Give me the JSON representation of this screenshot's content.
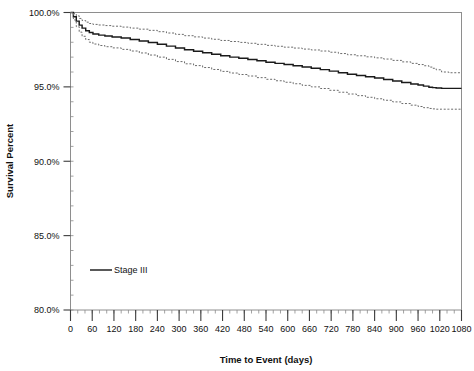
{
  "chart_data": {
    "type": "line",
    "title": "",
    "xlabel": "Time to Event (days)",
    "ylabel": "Survival Percent",
    "xlim": [
      0,
      1080
    ],
    "ylim": [
      80,
      100
    ],
    "grid": false,
    "legend_position": "inside-left",
    "x_ticks": [
      0,
      60,
      120,
      180,
      240,
      300,
      360,
      420,
      480,
      540,
      600,
      660,
      720,
      780,
      840,
      900,
      960,
      1020,
      1080
    ],
    "x_tick_labels": [
      "0",
      "60",
      "120",
      "180",
      "240",
      "300",
      "360",
      "420",
      "480",
      "540",
      "600",
      "660",
      "720",
      "780",
      "840",
      "900",
      "960",
      "1020",
      "1080"
    ],
    "y_ticks": [
      80,
      85,
      90,
      95,
      100
    ],
    "y_tick_labels": [
      "80.0%",
      "85.0%",
      "90.0%",
      "95.0%",
      "100.0%"
    ],
    "y_minor_tick_step": 1,
    "series": [
      {
        "name": "Stage III",
        "style": "solid",
        "color": "#1a1a1a",
        "x": [
          0,
          8,
          16,
          24,
          32,
          42,
          52,
          62,
          78,
          95,
          115,
          140,
          165,
          190,
          215,
          240,
          265,
          290,
          315,
          340,
          365,
          390,
          415,
          440,
          465,
          490,
          515,
          540,
          565,
          590,
          615,
          640,
          665,
          690,
          715,
          740,
          765,
          790,
          815,
          840,
          865,
          890,
          915,
          940,
          960,
          975,
          990,
          1000,
          1010,
          1025,
          1045,
          1080
        ],
        "values": [
          100.0,
          99.72,
          99.42,
          99.15,
          98.95,
          98.78,
          98.65,
          98.55,
          98.48,
          98.42,
          98.36,
          98.28,
          98.19,
          98.09,
          97.98,
          97.86,
          97.74,
          97.62,
          97.5,
          97.4,
          97.3,
          97.19,
          97.09,
          97.0,
          96.92,
          96.84,
          96.75,
          96.66,
          96.58,
          96.5,
          96.42,
          96.33,
          96.25,
          96.16,
          96.06,
          95.95,
          95.85,
          95.76,
          95.68,
          95.6,
          95.5,
          95.4,
          95.3,
          95.2,
          95.12,
          95.05,
          94.98,
          94.95,
          94.92,
          94.9,
          94.9,
          94.9
        ]
      },
      {
        "name": "Upper 95% confidence limit",
        "style": "dotted",
        "color": "#6b6b6b",
        "x": [
          0,
          8,
          16,
          24,
          32,
          42,
          52,
          62,
          78,
          95,
          115,
          140,
          165,
          190,
          215,
          240,
          265,
          290,
          315,
          340,
          365,
          390,
          415,
          440,
          465,
          490,
          515,
          540,
          565,
          590,
          615,
          640,
          665,
          690,
          715,
          740,
          765,
          790,
          815,
          840,
          865,
          890,
          915,
          940,
          960,
          975,
          990,
          1000,
          1010,
          1025,
          1045,
          1080
        ],
        "values": [
          100.0,
          99.92,
          99.78,
          99.6,
          99.46,
          99.35,
          99.26,
          99.2,
          99.16,
          99.12,
          99.08,
          99.02,
          98.95,
          98.88,
          98.8,
          98.71,
          98.62,
          98.53,
          98.44,
          98.36,
          98.28,
          98.2,
          98.12,
          98.05,
          97.99,
          97.93,
          97.86,
          97.79,
          97.73,
          97.67,
          97.61,
          97.54,
          97.48,
          97.41,
          97.33,
          97.24,
          97.16,
          97.09,
          97.02,
          96.95,
          96.87,
          96.78,
          96.68,
          96.58,
          96.5,
          96.42,
          96.33,
          96.25,
          96.15,
          96.0,
          95.95,
          95.95
        ]
      },
      {
        "name": "Lower 95% confidence limit",
        "style": "dotted",
        "color": "#6b6b6b",
        "x": [
          0,
          8,
          16,
          24,
          32,
          42,
          52,
          62,
          78,
          95,
          115,
          140,
          165,
          190,
          215,
          240,
          265,
          290,
          315,
          340,
          365,
          390,
          415,
          440,
          465,
          490,
          515,
          540,
          565,
          590,
          615,
          640,
          665,
          690,
          715,
          740,
          765,
          790,
          815,
          840,
          865,
          890,
          915,
          940,
          960,
          975,
          990,
          1000,
          1010,
          1025,
          1045,
          1080
        ],
        "values": [
          100.0,
          99.5,
          99.05,
          98.68,
          98.4,
          98.18,
          98.0,
          97.88,
          97.78,
          97.7,
          97.62,
          97.52,
          97.41,
          97.28,
          97.14,
          97.0,
          96.85,
          96.7,
          96.55,
          96.43,
          96.3,
          96.17,
          96.04,
          95.93,
          95.83,
          95.73,
          95.62,
          95.51,
          95.41,
          95.31,
          95.21,
          95.1,
          95.0,
          94.89,
          94.77,
          94.64,
          94.52,
          94.41,
          94.3,
          94.2,
          94.1,
          93.99,
          93.88,
          93.77,
          93.68,
          93.6,
          93.55,
          93.52,
          93.5,
          93.5,
          93.5,
          93.5
        ]
      }
    ],
    "legend": [
      {
        "label": "Stage III",
        "style": "solid",
        "color": "#1a1a1a"
      }
    ]
  }
}
